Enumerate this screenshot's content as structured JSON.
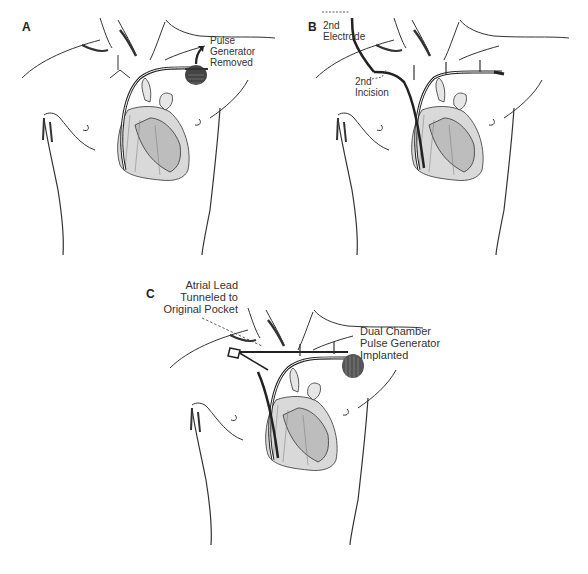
{
  "figure": {
    "panels": [
      {
        "id": "A",
        "letter": "A",
        "labels": [
          "Pulse",
          "Generator",
          "Removed"
        ]
      },
      {
        "id": "B",
        "letter": "B",
        "labels": {
          "electrode": [
            "2nd",
            "Electrode"
          ],
          "incision": [
            "2nd",
            "Incision"
          ]
        }
      },
      {
        "id": "C",
        "letter": "C",
        "labels": {
          "atrial_lead": [
            "Atrial Lead",
            "Tunneled to",
            "Original Pocket"
          ],
          "generator": [
            "Dual Chamber",
            "Pulse Generator",
            "Implanted"
          ]
        }
      }
    ]
  }
}
